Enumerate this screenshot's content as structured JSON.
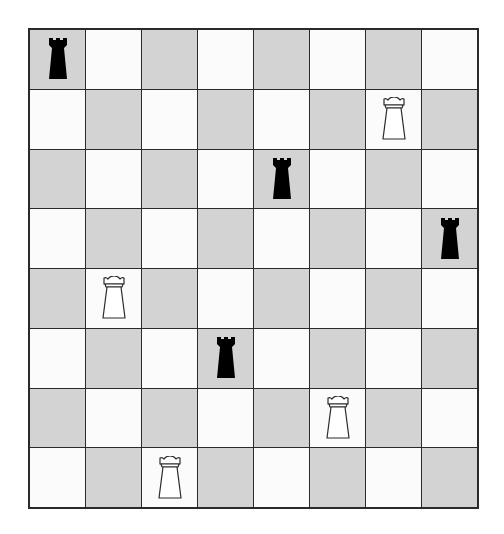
{
  "board": {
    "rows": 8,
    "cols": 8,
    "colors": {
      "light": "#fbfbfb",
      "dark": "#d3d3d3",
      "grid": "#2a2a2a"
    },
    "first_square": "dark"
  },
  "pieces": [
    {
      "row": 1,
      "col": 1,
      "type": "rook",
      "color": "black",
      "icon": "black-rook-icon"
    },
    {
      "row": 2,
      "col": 7,
      "type": "rook",
      "color": "white",
      "icon": "white-rook-icon"
    },
    {
      "row": 3,
      "col": 5,
      "type": "rook",
      "color": "black",
      "icon": "black-rook-icon"
    },
    {
      "row": 4,
      "col": 8,
      "type": "rook",
      "color": "black",
      "icon": "black-rook-icon"
    },
    {
      "row": 5,
      "col": 2,
      "type": "rook",
      "color": "white",
      "icon": "white-rook-icon"
    },
    {
      "row": 6,
      "col": 4,
      "type": "rook",
      "color": "black",
      "icon": "black-rook-icon"
    },
    {
      "row": 7,
      "col": 6,
      "type": "rook",
      "color": "white",
      "icon": "white-rook-icon"
    },
    {
      "row": 8,
      "col": 3,
      "type": "rook",
      "color": "white",
      "icon": "white-rook-icon"
    }
  ]
}
